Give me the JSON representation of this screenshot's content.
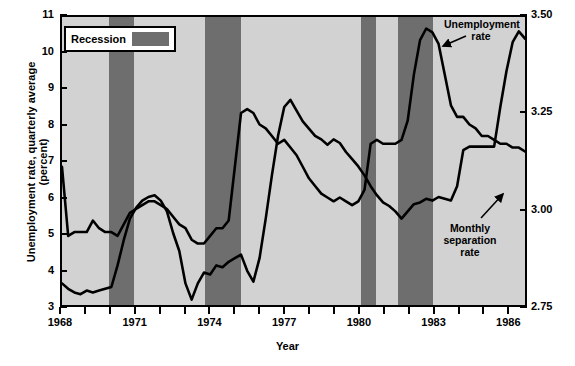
{
  "chart_data": {
    "type": "line",
    "title": "",
    "xlabel": "Year",
    "ylabel": "Unemployment rate, quarterly average (percent)",
    "ylabel_right": "Monthly separation rate (percent)",
    "xlim": [
      1968,
      1986.75
    ],
    "ylim": [
      3,
      11
    ],
    "ylim_right": [
      2.75,
      3.5
    ],
    "grid": false,
    "legend_position": "top-left",
    "xticks": [
      1968,
      1969,
      1970,
      1971,
      1972,
      1973,
      1974,
      1975,
      1976,
      1977,
      1978,
      1979,
      1980,
      1981,
      1982,
      1983,
      1984,
      1985,
      1986
    ],
    "xtick_labels": [
      "1968",
      "",
      "",
      "1971",
      "",
      "",
      "1974",
      "",
      "",
      "1977",
      "",
      "",
      "1980",
      "",
      "",
      "1983",
      "",
      "",
      "1986"
    ],
    "yticks_left": [
      3,
      4,
      5,
      6,
      7,
      8,
      9,
      10,
      11
    ],
    "ytick_labels_left": [
      "3",
      "4",
      "5",
      "6",
      "7",
      "8",
      "9",
      "10",
      "11"
    ],
    "yticks_right": [
      2.75,
      3.0,
      3.25,
      3.5
    ],
    "ytick_labels_right": [
      "2.75",
      "3.00",
      "3.25",
      "3.50"
    ],
    "legend": [
      {
        "label": "Recession",
        "color": "#6e6e6e",
        "type": "band"
      }
    ],
    "colors": {
      "plot_background": "#d2d2d2",
      "recession_band": "#6e6e6e",
      "line": "#000000",
      "page_background": "#ffffff"
    },
    "annotations": [
      {
        "text": "Unemployment rate",
        "target_x": 1982.6,
        "target_y_left": 10.4
      },
      {
        "text": "Monthly separation rate",
        "target_x": 1986.3,
        "target_y_right": 3.02
      }
    ],
    "recession_bands": [
      {
        "start": 1969.9,
        "end": 1970.9
      },
      {
        "start": 1973.75,
        "end": 1975.2
      },
      {
        "start": 1980.0,
        "end": 1980.6
      },
      {
        "start": 1981.5,
        "end": 1982.9
      }
    ],
    "series": [
      {
        "name": "Unemployment rate",
        "axis": "left",
        "unit": "percent",
        "x": [
          1968.0,
          1968.25,
          1968.5,
          1968.75,
          1969.0,
          1969.25,
          1969.5,
          1969.75,
          1970.0,
          1970.25,
          1970.5,
          1970.75,
          1971.0,
          1971.25,
          1971.5,
          1971.75,
          1972.0,
          1972.25,
          1972.5,
          1972.75,
          1973.0,
          1973.25,
          1973.5,
          1973.75,
          1974.0,
          1974.25,
          1974.5,
          1974.75,
          1975.0,
          1975.25,
          1975.5,
          1975.75,
          1976.0,
          1976.25,
          1976.5,
          1976.75,
          1977.0,
          1977.25,
          1977.5,
          1977.75,
          1978.0,
          1978.25,
          1978.5,
          1978.75,
          1979.0,
          1979.25,
          1979.5,
          1979.75,
          1980.0,
          1980.25,
          1980.5,
          1980.75,
          1981.0,
          1981.25,
          1981.5,
          1981.75,
          1982.0,
          1982.25,
          1982.5,
          1982.75,
          1983.0,
          1983.25,
          1983.5,
          1983.75,
          1984.0,
          1984.25,
          1984.5,
          1984.75,
          1985.0,
          1985.25,
          1985.5,
          1985.75,
          1986.0,
          1986.25,
          1986.5,
          1986.75
        ],
        "y": [
          3.6,
          3.45,
          3.35,
          3.3,
          3.4,
          3.35,
          3.4,
          3.45,
          3.5,
          4.1,
          4.8,
          5.4,
          5.7,
          5.9,
          6.0,
          6.05,
          5.9,
          5.6,
          5.0,
          4.5,
          3.6,
          3.15,
          3.6,
          3.9,
          3.85,
          4.1,
          4.05,
          4.2,
          4.3,
          4.4,
          3.95,
          3.65,
          4.3,
          5.4,
          6.6,
          7.7,
          8.5,
          8.7,
          8.4,
          8.1,
          7.9,
          7.7,
          7.6,
          7.45,
          7.6,
          7.5,
          7.25,
          7.05,
          6.85,
          6.6,
          6.3,
          6.05,
          5.85,
          5.75,
          5.6,
          5.4,
          5.6,
          5.8,
          5.85,
          5.95,
          5.9,
          6.0,
          5.95,
          5.9,
          6.3,
          7.3,
          7.4,
          7.4,
          7.4,
          7.4,
          7.4,
          8.5,
          9.5,
          10.3,
          10.6,
          10.4
        ],
        "note": "quarterly average, left axis"
      },
      {
        "name": "Monthly separation rate",
        "axis": "right",
        "unit": "percent",
        "x": [
          1968.0,
          1968.25,
          1968.5,
          1968.75,
          1969.0,
          1969.25,
          1969.5,
          1969.75,
          1970.0,
          1970.25,
          1970.5,
          1970.75,
          1971.0,
          1971.25,
          1971.5,
          1971.75,
          1972.0,
          1972.25,
          1972.5,
          1972.75,
          1973.0,
          1973.25,
          1973.5,
          1973.75,
          1974.0,
          1974.25,
          1974.5,
          1974.75,
          1975.0,
          1975.25,
          1975.5,
          1975.75,
          1976.0,
          1976.25,
          1976.5,
          1976.75,
          1977.0,
          1977.25,
          1977.5,
          1977.75,
          1978.0,
          1978.25,
          1978.5,
          1978.75,
          1979.0,
          1979.25,
          1979.5,
          1979.75,
          1980.0,
          1980.25,
          1980.5,
          1980.75,
          1981.0,
          1981.25,
          1981.5,
          1981.75,
          1982.0,
          1982.25,
          1982.5,
          1982.75,
          1983.0,
          1983.25,
          1983.5,
          1983.75,
          1984.0,
          1984.25,
          1984.5,
          1984.75,
          1985.0,
          1985.25,
          1985.5,
          1985.75,
          1986.0,
          1986.25,
          1986.5,
          1986.75
        ],
        "y_left_scale": [
          6.0,
          4.95,
          5.0,
          5.0,
          5.0,
          5.35,
          5.15,
          5.0,
          5.0,
          4.95,
          5.25,
          5.5,
          5.65,
          5.8,
          5.85,
          5.85,
          5.8,
          5.7,
          5.5,
          5.3,
          5.1,
          4.85,
          4.75,
          4.7,
          4.85,
          5.1,
          5.05,
          5.3,
          6.8,
          8.3,
          8.4,
          8.25,
          8.0,
          7.85,
          7.65,
          7.45,
          7.55,
          7.35,
          7.1,
          6.85,
          6.5,
          6.25,
          6.05,
          5.95,
          5.85,
          5.95,
          5.85,
          5.75,
          5.85,
          6.1,
          7.4,
          7.45,
          7.4,
          7.4,
          7.4,
          7.45,
          8.0,
          9.3,
          10.3,
          10.6,
          10.5,
          10.2,
          9.2,
          8.4,
          8.1,
          8.1,
          7.9,
          7.7,
          7.55,
          7.5,
          7.4,
          7.3,
          7.25,
          7.2,
          7.15,
          7.1
        ],
        "y": [
          3.11,
          2.93,
          2.94,
          2.94,
          2.94,
          2.97,
          2.95,
          2.94,
          2.94,
          2.93,
          2.96,
          2.99,
          3.0,
          3.01,
          3.02,
          3.02,
          3.01,
          3.0,
          2.98,
          2.96,
          2.95,
          2.92,
          2.91,
          2.91,
          2.93,
          2.95,
          2.95,
          2.97,
          3.11,
          3.25,
          3.26,
          3.25,
          3.22,
          3.21,
          3.19,
          3.17,
          3.18,
          3.16,
          3.14,
          3.11,
          3.08,
          3.06,
          3.04,
          3.03,
          3.02,
          3.03,
          3.02,
          3.01,
          3.02,
          3.05,
          3.17,
          3.18,
          3.17,
          3.17,
          3.17,
          3.18,
          3.23,
          3.35,
          3.44,
          3.47,
          3.46,
          3.43,
          3.35,
          3.27,
          3.24,
          3.24,
          3.22,
          3.21,
          3.19,
          3.19,
          3.18,
          3.17,
          3.17,
          3.16,
          3.16,
          3.15
        ],
        "note": "right axis"
      }
    ]
  },
  "legend": {
    "recession_label": "Recession"
  },
  "annotations": {
    "unemployment": "Unemployment rate",
    "separation": "Monthly separation rate"
  },
  "axes": {
    "x_title": "Year",
    "y_title_left": "Unemployment rate, quarterly average (percent)",
    "y_title_right": "Monthly separation rate (percent)"
  }
}
